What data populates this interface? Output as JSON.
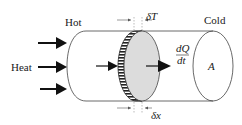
{
  "diagram": {
    "labels": {
      "hot": "Hot",
      "cold": "Cold",
      "heat": "Heat",
      "delta_T": "δT",
      "delta_x": "δx",
      "dQ": "dQ",
      "dt": "dt",
      "area": "A"
    },
    "colors": {
      "stroke": "#333333",
      "arrow": "#111111",
      "disk_fill": "#dcdcdc",
      "hatch": "#222222",
      "background": "#ffffff"
    },
    "heat_arrows": 3
  }
}
